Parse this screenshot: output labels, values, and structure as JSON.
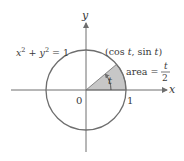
{
  "diagram": {
    "equation": {
      "x_part": "x",
      "sup1": "2",
      "plus": " + ",
      "y_part": "y",
      "sup2": "2",
      "rhs": " = 1"
    },
    "axes": {
      "x_label": "x",
      "y_label": "y"
    },
    "origin_label": "0",
    "one_label": "1",
    "point_label": {
      "open": "(cos ",
      "t1": "t",
      "mid": ", sin ",
      "t2": "t",
      "close": ")"
    },
    "angle_label": "t",
    "area_label": {
      "prefix": "area = ",
      "numerator": "t",
      "denominator": "2"
    },
    "colors": {
      "circle": "#6e6e6e",
      "sector_fill": "#c7c7c7",
      "axis": "#6e6e6e",
      "text": "#3a3a3a"
    },
    "geometry": {
      "center": [
        86,
        90
      ],
      "radius": 40,
      "angle_deg": 40
    }
  }
}
